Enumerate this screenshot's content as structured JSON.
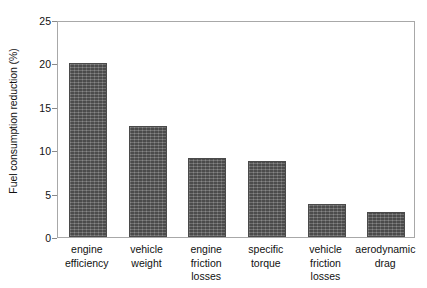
{
  "chart_data": {
    "type": "bar",
    "title": "",
    "subtitle": "",
    "xlabel": "",
    "ylabel": "Fuel consumption reduction (%)",
    "categories": [
      "engine efficiency",
      "vehicle weight",
      "engine friction losses",
      "specific torque",
      "vehicle friction losses",
      "aerodynamic drag"
    ],
    "category_lines": [
      [
        "engine",
        "efficiency"
      ],
      [
        "vehicle",
        "weight"
      ],
      [
        "engine",
        "friction",
        "losses"
      ],
      [
        "specific",
        "torque"
      ],
      [
        "vehicle",
        "friction",
        "losses"
      ],
      [
        "aerodynamic",
        "drag"
      ]
    ],
    "values": [
      20.0,
      12.8,
      9.1,
      8.7,
      3.8,
      2.9
    ],
    "ylim": [
      0,
      25
    ],
    "yticks": [
      0,
      5,
      10,
      15,
      20,
      25
    ],
    "ytick_labels": [
      "0",
      "5",
      "10",
      "15",
      "20",
      "25"
    ],
    "grid": false,
    "legend": null,
    "bar_color": "#5c5c5c",
    "bar_edge_color": "#4a4a4a",
    "axis_color": "#a8a8a8",
    "background_color": "#ffffff"
  }
}
